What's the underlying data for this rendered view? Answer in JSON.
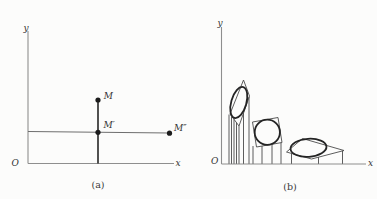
{
  "palette": {
    "background": "#fcfcfb",
    "axis_gray": "#8e8e8e",
    "line_thin": "#4b4b4b",
    "ink_dark": "#242424",
    "label_color": "#333333"
  },
  "panel_a": {
    "caption": "(a)",
    "axis": {
      "y_label": "y",
      "x_label": "x",
      "origin_label": "O"
    },
    "points": [
      {
        "label": "M"
      },
      {
        "label": "M′"
      },
      {
        "label": "M″"
      }
    ]
  },
  "panel_b": {
    "caption": "(b)",
    "axis": {
      "y_label": "y",
      "x_label": "x",
      "origin_label": "O"
    },
    "stages_count": "3"
  }
}
